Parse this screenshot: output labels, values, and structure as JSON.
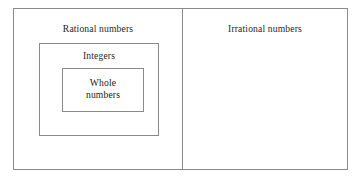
{
  "diagram": {
    "type": "nested-set-containment",
    "background_color": "#ffffff",
    "border_color": "#8a8a8a",
    "text_color": "#1f1f1f",
    "panels": {
      "left": {
        "label": "Rational numbers",
        "nested": {
          "label": "Integers",
          "nested": {
            "label_line_1": "Whole",
            "label_line_2": "numbers",
            "label_full": "Whole numbers"
          }
        }
      },
      "right": {
        "label": "Irrational numbers",
        "contents": ""
      }
    }
  }
}
